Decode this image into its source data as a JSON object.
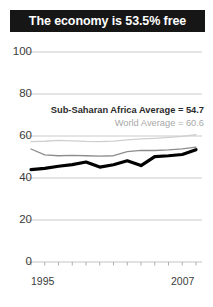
{
  "title": {
    "text": "The economy is 53.5% free"
  },
  "annotations": {
    "africa": "Sub-Saharan Africa Average = 54.7",
    "world": "World Average = 60.6"
  },
  "chart_data": {
    "type": "line",
    "title": "The economy is 53.5% free",
    "xlabel": "",
    "ylabel": "",
    "ylim": [
      0,
      100
    ],
    "yticks": [
      0,
      20,
      40,
      60,
      80,
      100
    ],
    "xlim": [
      1995,
      2007
    ],
    "xticks": [
      1995,
      1996,
      1997,
      1998,
      1999,
      2000,
      2001,
      2002,
      2003,
      2004,
      2005,
      2006,
      2007
    ],
    "xtick_labels_shown": [
      "1995",
      "2007"
    ],
    "grid": true,
    "legend_position": "inline-right",
    "x": [
      1995,
      1996,
      1997,
      1998,
      1999,
      2000,
      2001,
      2002,
      2003,
      2004,
      2005,
      2006,
      2007
    ],
    "series": [
      {
        "name": "Country economic freedom",
        "color": "#000000",
        "width": 3.2,
        "values": [
          44.0,
          44.6,
          45.6,
          46.4,
          47.6,
          45.2,
          46.3,
          48.2,
          45.9,
          50.2,
          50.6,
          51.2,
          53.5
        ]
      },
      {
        "name": "Sub-Saharan Africa Average",
        "color": "#8c8c8c",
        "width": 1.3,
        "values": [
          53.8,
          51.0,
          50.6,
          50.8,
          50.6,
          50.4,
          50.6,
          52.6,
          53.2,
          53.1,
          53.4,
          53.9,
          54.7
        ]
      },
      {
        "name": "World Average",
        "color": "#cfcfcf",
        "width": 1.3,
        "values": [
          57.3,
          57.5,
          57.9,
          57.7,
          57.4,
          57.3,
          57.6,
          58.2,
          58.6,
          58.9,
          59.3,
          59.8,
          60.6
        ]
      }
    ]
  }
}
